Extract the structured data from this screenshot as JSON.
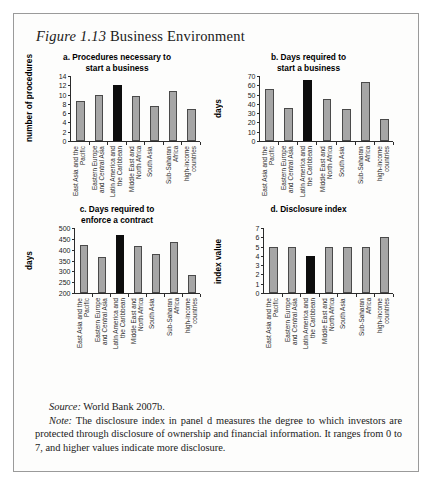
{
  "figure": {
    "number": "Figure 1.13",
    "title": "Business Environment"
  },
  "footnotes": {
    "source_label": "Source:",
    "source_text": "World Bank 2007b.",
    "note_label": "Note:",
    "note_text": "The disclosure index in panel d measures the degree to which investors are protected through disclosure of ownership and financial information. It ranges from 0 to 7, and higher values indicate more disclosure."
  },
  "categories": [
    "East Asia and the\nPacific",
    "Eastern Europe\nand Central Asia",
    "Latin America and\nthe Caribbean",
    "Middle East and\nNorth Africa",
    "South Asia",
    "Sub-Saharan Africa",
    "high-income\ncountries"
  ],
  "colors": {
    "bar": "#a6a6a6",
    "bar_highlight": "#0d0d0d",
    "bar_outline": "#4a4a4a",
    "axis": "#2b2b2b",
    "border": "#9a9a9a"
  },
  "chart_data": [
    {
      "type": "bar",
      "panel": "a",
      "title": "a. Procedures necessary to\nstart a business",
      "xlabel": "",
      "ylabel": "number of procedures",
      "ylim": [
        0,
        14
      ],
      "yticks": [
        0,
        2,
        4,
        6,
        8,
        10,
        12,
        14
      ],
      "grid": false,
      "legend": "none",
      "categories": [
        "East Asia and the Pacific",
        "Eastern Europe and Central Asia",
        "Latin America and the Caribbean",
        "Middle East and North Africa",
        "South Asia",
        "Sub-Saharan Africa",
        "high-income countries"
      ],
      "values": [
        8.7,
        10.0,
        12.0,
        9.7,
        7.6,
        10.8,
        6.9
      ],
      "highlight_index": 2
    },
    {
      "type": "bar",
      "panel": "b",
      "title": "b. Days required to\nstart a business",
      "xlabel": "",
      "ylabel": "days",
      "ylim": [
        0,
        70
      ],
      "yticks": [
        0,
        10,
        20,
        30,
        40,
        50,
        60,
        70
      ],
      "grid": false,
      "legend": "none",
      "categories": [
        "East Asia and the Pacific",
        "Eastern Europe and Central Asia",
        "Latin America and the Caribbean",
        "Middle East and North Africa",
        "South Asia",
        "Sub-Saharan Africa",
        "high-income countries"
      ],
      "values": [
        56,
        36,
        66,
        45,
        34.5,
        64,
        24
      ],
      "highlight_index": 2
    },
    {
      "type": "bar",
      "panel": "c",
      "title": "c. Days required to\nenforce a contract",
      "xlabel": "",
      "ylabel": "days",
      "ylim": [
        200,
        500
      ],
      "yticks": [
        200,
        250,
        300,
        350,
        400,
        450,
        500
      ],
      "grid": false,
      "legend": "none",
      "categories": [
        "East Asia and the Pacific",
        "Eastern Europe and Central Asia",
        "Latin America and the Caribbean",
        "Middle East and North Africa",
        "South Asia",
        "Sub-Saharan Africa",
        "high-income countries"
      ],
      "values": [
        422,
        368,
        470,
        418,
        382,
        437,
        281
      ],
      "highlight_index": 2
    },
    {
      "type": "bar",
      "panel": "d",
      "title": "d. Disclosure index",
      "xlabel": "",
      "ylabel": "index value",
      "ylim": [
        0,
        7
      ],
      "yticks": [
        0,
        1,
        2,
        3,
        4,
        5,
        6,
        7
      ],
      "grid": false,
      "legend": "none",
      "categories": [
        "East Asia and the Pacific",
        "Eastern Europe and Central Asia",
        "Latin America and the Caribbean",
        "Middle East and North Africa",
        "South Asia",
        "Sub-Saharan Africa",
        "high-income countries"
      ],
      "values": [
        5,
        5,
        4,
        5,
        5,
        5,
        6
      ],
      "highlight_index": 2
    }
  ]
}
